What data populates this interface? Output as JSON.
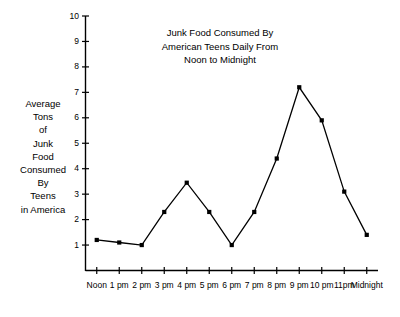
{
  "chart_data": {
    "type": "line",
    "title": "Junk Food Consumed By\nAmerican Teens Daily From\nNoon to Midnight",
    "xlabel": "",
    "ylabel": "Average\nTons\nof\nJunk\nFood\nConsumed\nBy\nTeens\nin America",
    "categories": [
      "Noon",
      "1 pm",
      "2 pm",
      "3 pm",
      "4 pm",
      "5 pm",
      "6 pm",
      "7 pm",
      "8 pm",
      "9 pm",
      "10 pm",
      "11pm",
      "Midnight"
    ],
    "values": [
      1.2,
      1.1,
      1.0,
      2.3,
      3.45,
      2.3,
      1.0,
      2.3,
      4.4,
      7.2,
      5.9,
      3.1,
      1.4
    ],
    "ylim": [
      0,
      10
    ],
    "yticks": [
      1,
      2,
      3,
      4,
      5,
      6,
      7,
      8,
      9,
      10
    ],
    "ytick_labels": [
      "1",
      "2",
      "3",
      "4",
      "5",
      "6",
      "7",
      "8",
      "9",
      "10"
    ],
    "grid": false,
    "legend": false,
    "marker": "square",
    "line_color": "#000000",
    "marker_color": "#000000",
    "background_color": "#ffffff"
  }
}
